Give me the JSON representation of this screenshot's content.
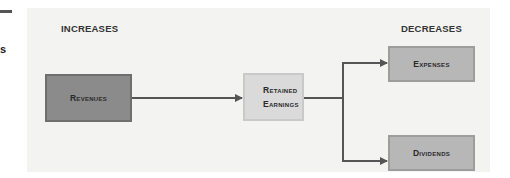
{
  "left_fragment": {
    "text": "s"
  },
  "diagram": {
    "increases_label": "INCREASES",
    "decreases_label": "DECREASES",
    "nodes": {
      "revenues": {
        "label": "Revenues"
      },
      "retained_earnings": {
        "line1": "Retained",
        "line2": "Earnings"
      },
      "expenses": {
        "label": "Expenses"
      },
      "dividends": {
        "label": "Dividends"
      }
    },
    "edges": [
      {
        "from": "revenues",
        "to": "retained_earnings"
      },
      {
        "from": "retained_earnings",
        "to": "expenses"
      },
      {
        "from": "retained_earnings",
        "to": "dividends"
      }
    ],
    "colors": {
      "panel": "#f3f3f2",
      "revenues": "#8b8b8b",
      "retained_earnings": "#dadada",
      "decrease_boxes": "#b7b7b7",
      "connector": "#555555"
    }
  }
}
